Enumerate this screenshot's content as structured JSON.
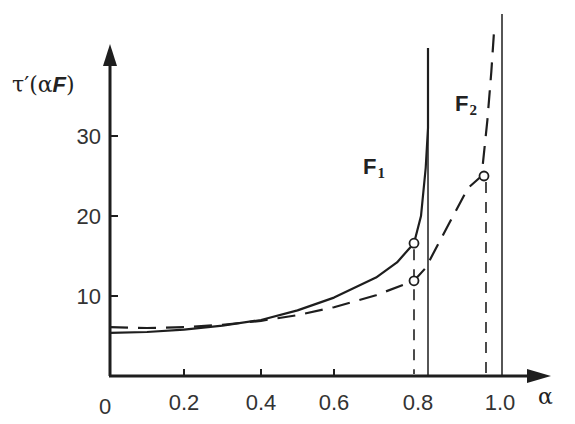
{
  "chart_data": {
    "type": "line",
    "title": "",
    "xlabel": "α",
    "ylabel": "τ′(αF)",
    "xlim": [
      0,
      1.05
    ],
    "ylim": [
      0,
      45
    ],
    "x_ticks": [
      0.2,
      0.4,
      0.6,
      0.8,
      1.0
    ],
    "x_tick_labels": [
      "0",
      "0.2",
      "0.4",
      "0.6",
      "0.8",
      "1.0"
    ],
    "y_ticks": [
      10,
      20,
      30
    ],
    "y_tick_labels": [
      "10",
      "20",
      "30"
    ],
    "grid": false,
    "legend": "inline labels",
    "series": [
      {
        "name": "F1",
        "style": "solid",
        "x": [
          0,
          0.1,
          0.2,
          0.3,
          0.4,
          0.5,
          0.6,
          0.7,
          0.75,
          0.79,
          0.805,
          0.815,
          0.82
        ],
        "values": [
          5.4,
          5.5,
          5.8,
          6.3,
          7.0,
          8.2,
          9.8,
          12.3,
          14.2,
          16.6,
          20,
          26,
          31
        ],
        "asymptote_x": 0.82,
        "marked_point": {
          "x": 0.79,
          "y": 16.6
        }
      },
      {
        "name": "F2",
        "style": "dashed",
        "x": [
          0,
          0.1,
          0.2,
          0.3,
          0.4,
          0.5,
          0.6,
          0.7,
          0.79,
          0.82,
          0.88,
          0.93,
          0.965,
          0.98,
          0.99,
          0.997
        ],
        "values": [
          6.1,
          6.0,
          6.1,
          6.4,
          6.9,
          7.6,
          8.6,
          10.1,
          11.9,
          13.5,
          19,
          23.5,
          25,
          32,
          38,
          43
        ],
        "asymptote_x": 1.0,
        "marked_point": {
          "x": 0.965,
          "y": 25
        }
      }
    ],
    "annotations": [
      {
        "type": "dashed-vertical",
        "x": 0.79,
        "from": 0,
        "to": 16.6
      },
      {
        "type": "dashed-vertical",
        "x": 0.965,
        "from": 0,
        "to": 25
      },
      {
        "type": "solid-vertical",
        "x": 0.82,
        "label": "asymptote F1"
      },
      {
        "type": "solid-vertical",
        "x": 1.0,
        "label": "asymptote F2"
      }
    ],
    "labels": {
      "f1_main": "F",
      "f1_sub": "1",
      "f2_main": "F",
      "f2_sub": "2",
      "y_axis_title": "τ′(αF)",
      "x_axis_title": "α",
      "origin": "0"
    }
  }
}
